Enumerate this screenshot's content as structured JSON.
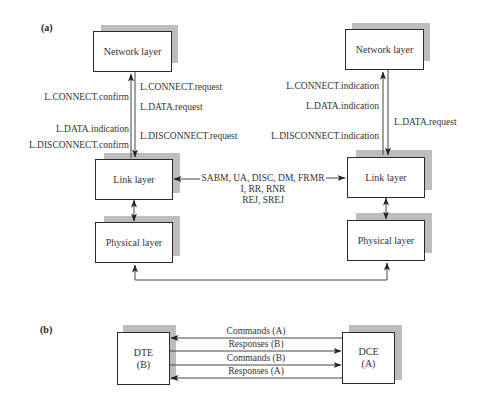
{
  "part_a": {
    "label": "(a)",
    "left_stack": {
      "network": "Network layer",
      "link": "Link layer",
      "physical": "Physical layer",
      "up_primitives": [
        "L.CONNECT.confirm",
        "L.DATA.indication",
        "L.DISCONNECT.confirm"
      ],
      "down_primitives": [
        "L.CONNECT.request",
        "L.DATA.request",
        "L.DISCONNECT.request"
      ]
    },
    "right_stack": {
      "network": "Network layer",
      "link": "Link layer",
      "physical": "Physical layer",
      "up_primitives": [
        "L.CONNECT.indication",
        "L.DATA.indication",
        "L.DISCONNECT.indication"
      ],
      "down_primitives": [
        "L.DATA.request"
      ]
    },
    "frames": {
      "line1": "SABM, UA, DISC, DM, FRMR",
      "line2": "I, RR, RNR",
      "line3": "REJ, SREJ"
    }
  },
  "part_b": {
    "label": "(b)",
    "dte": {
      "name": "DTE",
      "role": "(B)"
    },
    "dce": {
      "name": "DCE",
      "role": "(A)"
    },
    "arrows": [
      {
        "label": "Commands (A)",
        "direction": "to-dte"
      },
      {
        "label": "Responses (B)",
        "direction": "to-dce"
      },
      {
        "label": "Commands (B)",
        "direction": "to-dce"
      },
      {
        "label": "Responses (A)",
        "direction": "to-dte"
      }
    ]
  }
}
